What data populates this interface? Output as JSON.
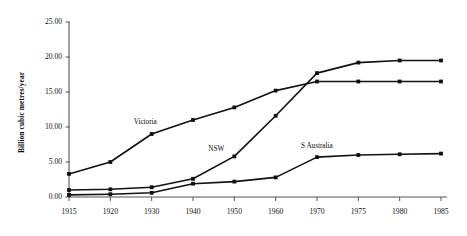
{
  "chart_data": {
    "type": "line",
    "title": "",
    "subtitle": "",
    "xlabel": "",
    "ylabel": "Billion cubic metres/year",
    "categories": [
      "1915",
      "1920",
      "1930",
      "1940",
      "1950",
      "1960",
      "1970",
      "1975",
      "1980",
      "1985"
    ],
    "xtick_labels": [
      "1915",
      "1920",
      "1930",
      "1940",
      "1950",
      "1960",
      "1970",
      "1975",
      "1980",
      "1985"
    ],
    "ytick_labels": [
      "0.00",
      "5.00",
      "10.00",
      "15.00",
      "20.00",
      "25.00"
    ],
    "ytick_values": [
      0,
      5,
      10,
      15,
      20,
      25
    ],
    "ylim": [
      0,
      25
    ],
    "grid": false,
    "legend_position": "inline-annotations",
    "axis_color": "#555555",
    "line_color": "#111111",
    "marker": "square",
    "series": [
      {
        "name": "Victoria",
        "label": "Victoria",
        "color": "#111111",
        "label_x_category": "1930",
        "values": [
          3.3,
          5.0,
          9.0,
          11.0,
          12.8,
          15.2,
          16.5,
          16.5,
          16.5,
          16.5
        ]
      },
      {
        "name": "NSW",
        "label": "NSW",
        "color": "#111111",
        "label_x_category": "1950",
        "values": [
          1.0,
          1.1,
          1.4,
          2.6,
          5.8,
          11.6,
          17.7,
          19.2,
          19.5,
          19.5
        ]
      },
      {
        "name": "S Australia",
        "label": "S Australia",
        "color": "#111111",
        "label_x_category": "1970",
        "values": [
          0.3,
          0.4,
          0.6,
          1.9,
          2.2,
          2.8,
          5.7,
          6.0,
          6.1,
          6.2
        ]
      }
    ],
    "annotations": [
      {
        "text": "Victoria",
        "series": "Victoria"
      },
      {
        "text": "NSW",
        "series": "NSW"
      },
      {
        "text": "S Australia",
        "series": "S Australia"
      }
    ]
  }
}
